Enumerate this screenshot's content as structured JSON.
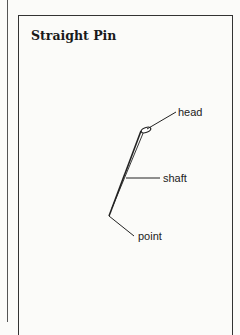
{
  "title": "Straight Pin",
  "labels": {
    "head": "head",
    "shaft": "shaft",
    "point": "point"
  },
  "colors": {
    "ink": "#222222",
    "background": "#fbfbf9"
  }
}
